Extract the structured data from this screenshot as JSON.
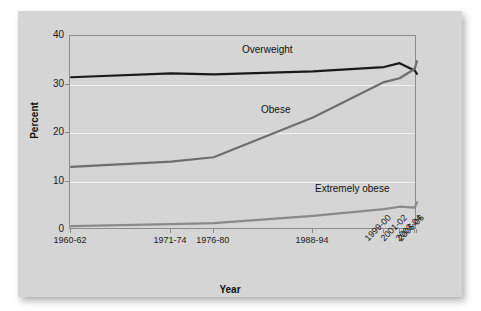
{
  "chart_data": {
    "type": "line",
    "title": "",
    "xlabel": "Year",
    "ylabel": "Percent",
    "ylim": [
      0,
      40
    ],
    "yticks": [
      0,
      10,
      20,
      30,
      40
    ],
    "grid": "horizontal-white",
    "legend": "inline-annotations",
    "categories": [
      "1960-62",
      "1971-74",
      "1976-80",
      "1988-94",
      "1999-00",
      "2001-02",
      "2003-04",
      "2005-06"
    ],
    "series": [
      {
        "name": "Overweight",
        "color": "#1a1a1a",
        "values": [
          31.5,
          32.3,
          32.1,
          32.7,
          33.6,
          34.4,
          32.9,
          32.2
        ]
      },
      {
        "name": "Obese",
        "color": "#6e6e6e",
        "values": [
          13.0,
          14.1,
          15.0,
          23.2,
          30.5,
          31.3,
          33.2,
          34.8
        ]
      },
      {
        "name": "Extremely obese",
        "color": "#8a8a8a",
        "values": [
          0.8,
          1.2,
          1.4,
          2.9,
          4.3,
          4.8,
          4.6,
          5.7
        ]
      }
    ]
  },
  "axes": {
    "y_title": "Percent",
    "x_title": "Year",
    "y_tick_labels": [
      "0",
      "10",
      "20",
      "30",
      "40"
    ],
    "x_tick_labels": [
      "1960-62",
      "1971-74",
      "1976-80",
      "1988-94",
      "1999-00",
      "2001-02",
      "2003-04",
      "2005-06"
    ]
  },
  "annotations": {
    "overweight": "Overweight",
    "obese": "Obese",
    "extremely_obese": "Extremely obese"
  },
  "colors": {
    "panel_background": "#d5d5d5",
    "frame": "#8c8c8c",
    "gridline": "#f2f2f2",
    "overweight_line": "#1a1a1a",
    "obese_line": "#6e6e6e",
    "extremely_obese_line": "#8a8a8a",
    "text": "#111111"
  }
}
